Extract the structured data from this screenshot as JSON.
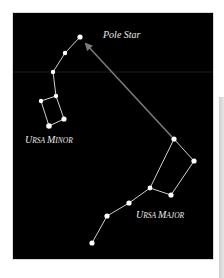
{
  "diagram": {
    "colors": {
      "background": "#000000",
      "star": "#ffffff",
      "line": "#d0d0d0",
      "pointer_arrow": "#7a7a7a",
      "label": "#e8e8e8"
    },
    "labels": {
      "pole_star": "Pole Star",
      "ursa_minor_initial_1": "U",
      "ursa_minor_rest_1": "RSA ",
      "ursa_minor_initial_2": "M",
      "ursa_minor_rest_2": "INOR",
      "ursa_major_initial_1": "U",
      "ursa_major_rest_1": "RSA ",
      "ursa_major_initial_2": "M",
      "ursa_major_rest_2": "AJOR"
    },
    "constellations": [
      {
        "name": "Ursa Minor",
        "star_count": 7
      },
      {
        "name": "Ursa Major",
        "star_count": 7
      }
    ],
    "pointer": {
      "from": "Ursa Major pointer star",
      "to": "Pole Star",
      "icon": "arrow-icon"
    }
  }
}
